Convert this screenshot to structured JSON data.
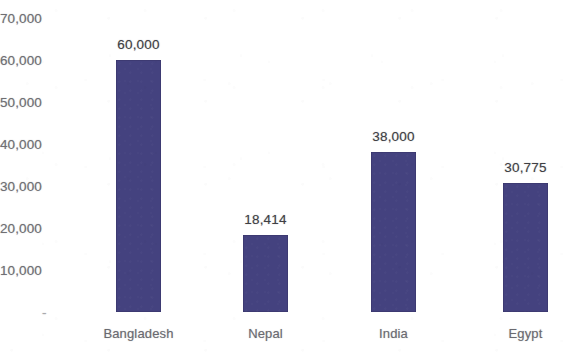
{
  "chart_data": {
    "type": "bar",
    "title": "",
    "subtitle": "",
    "xlabel": "",
    "ylabel": "",
    "categories": [
      "Bangladesh",
      "Nepal",
      "India",
      "Egypt"
    ],
    "values": [
      60000,
      18414,
      38000,
      30775
    ],
    "data_labels": [
      "60,000",
      "18,414",
      "38,000",
      "30,775"
    ],
    "ytick_labels": [
      "70,000",
      "60,000",
      "50,000",
      "40,000",
      "30,000",
      "20,000",
      "10,000",
      "-"
    ],
    "ytick_values": [
      70000,
      60000,
      50000,
      40000,
      30000,
      20000,
      10000,
      0
    ],
    "ylim": [
      0,
      70000
    ],
    "grid": false,
    "legend": false,
    "legend_position": "none",
    "orientation": "vertical",
    "bar_color": "#44427f",
    "label_color": "#3f3f44",
    "axis_text_color": "#6f6f73",
    "background_color": "#ffffff"
  }
}
